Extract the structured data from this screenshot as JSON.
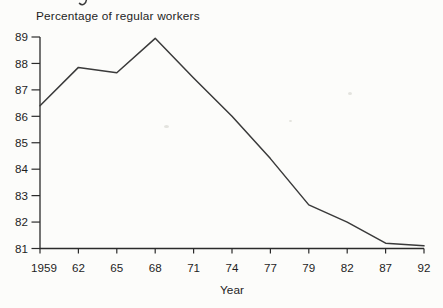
{
  "figure": {
    "title": "Percentage of regular workers",
    "xlabel": "Year"
  },
  "chart_data": {
    "type": "line",
    "title": "Percentage of regular workers",
    "xlabel": "Year",
    "ylabel": "",
    "categories": [
      "1959",
      "62",
      "65",
      "68",
      "71",
      "74",
      "77",
      "79",
      "82",
      "87",
      "92"
    ],
    "values": [
      86.4,
      87.85,
      87.65,
      88.95,
      87.45,
      86.0,
      84.4,
      82.65,
      82.0,
      81.2,
      81.1
    ],
    "yticks": [
      81,
      82,
      83,
      84,
      85,
      86,
      87,
      88,
      89
    ],
    "ylim": [
      81,
      89
    ],
    "grid": false,
    "legend": "none",
    "line_color": "#3a3a3a",
    "axis_color": "#2b2b2b",
    "text_color": "#1e1e1e",
    "background": "#fcfcfa"
  }
}
